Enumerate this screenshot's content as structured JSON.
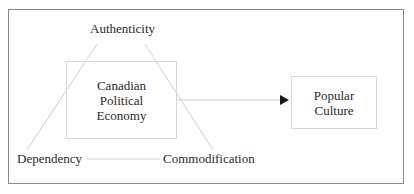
{
  "diagram": {
    "nodes": {
      "authenticity": "Authenticity",
      "dependency": "Dependency",
      "commodification": "Commodification",
      "center_box": "Canadian\nPolitical\nEconomy",
      "target_box": "Popular\nCulture"
    },
    "edges": [
      {
        "from": "Authenticity",
        "to": "Dependency",
        "style": "line"
      },
      {
        "from": "Authenticity",
        "to": "Commodification",
        "style": "line"
      },
      {
        "from": "Dependency",
        "to": "Commodification",
        "style": "line"
      },
      {
        "from": "Canadian Political Economy",
        "to": "Popular Culture",
        "style": "arrow"
      }
    ],
    "colors": {
      "frame": "#8a8a8a",
      "thin_lines": "#d0d0d0",
      "arrow": "#1a1a1a",
      "text": "#2a2a2a"
    }
  }
}
